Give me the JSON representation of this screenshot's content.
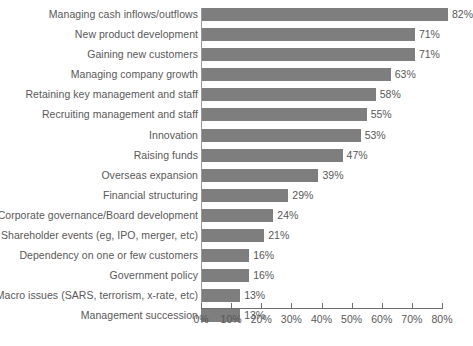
{
  "chart_data": {
    "type": "bar",
    "orientation": "horizontal",
    "title": "",
    "xlabel": "",
    "ylabel": "",
    "xlim": [
      0,
      80
    ],
    "grid": false,
    "legend": false,
    "tick_labels": [
      "0%",
      "10%",
      "20%",
      "30%",
      "40%",
      "50%",
      "60%",
      "70%",
      "80%"
    ],
    "ticks": [
      0,
      10,
      20,
      30,
      40,
      50,
      60,
      70,
      80
    ],
    "bar_color": "#7e7e7e",
    "text_color": "#585858",
    "categories": [
      "Managing cash inflows/outflows",
      "New product development",
      "Gaining new customers",
      "Managing company growth",
      "Retaining key management and staff",
      "Recruiting management and staff",
      "Innovation",
      "Raising funds",
      "Overseas expansion",
      "Financial structuring",
      "Corporate governance/Board development",
      "Shareholder events (eg, IPO, merger, etc)",
      "Dependency on one or few customers",
      "Government policy",
      "Macro issues (SARS, terrorism, x-rate, etc)",
      "Management succession"
    ],
    "values": [
      82,
      71,
      71,
      63,
      58,
      55,
      53,
      47,
      39,
      29,
      24,
      21,
      16,
      16,
      13,
      13
    ],
    "value_labels": [
      "82%",
      "71%",
      "71%",
      "63%",
      "58%",
      "55%",
      "53%",
      "47%",
      "39%",
      "29%",
      "24%",
      "21%",
      "16%",
      "16%",
      "13%",
      "13%"
    ]
  }
}
